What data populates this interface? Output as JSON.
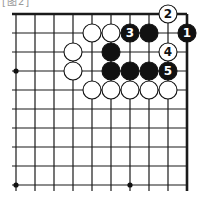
{
  "caption": "[图2]",
  "board": {
    "origin_x": 16,
    "origin_y": 14,
    "spacing": 19,
    "cols": 10,
    "rows": 10,
    "line_color": "#1a1a1a",
    "star_points": [
      [
        0,
        3
      ],
      [
        0,
        9
      ],
      [
        6,
        9
      ]
    ]
  },
  "stones": [
    {
      "col": 9,
      "row": 1,
      "color": "black",
      "label": "1"
    },
    {
      "col": 8,
      "row": 0,
      "color": "white",
      "label": "2"
    },
    {
      "col": 6,
      "row": 1,
      "color": "black",
      "label": "3"
    },
    {
      "col": 8,
      "row": 2,
      "color": "white",
      "label": "4"
    },
    {
      "col": 8,
      "row": 3,
      "color": "black",
      "label": "5"
    },
    {
      "col": 4,
      "row": 1,
      "color": "white",
      "label": ""
    },
    {
      "col": 5,
      "row": 1,
      "color": "white",
      "label": ""
    },
    {
      "col": 7,
      "row": 1,
      "color": "black",
      "label": ""
    },
    {
      "col": 3,
      "row": 2,
      "color": "white",
      "label": ""
    },
    {
      "col": 5,
      "row": 2,
      "color": "black",
      "label": ""
    },
    {
      "col": 3,
      "row": 3,
      "color": "white",
      "label": ""
    },
    {
      "col": 5,
      "row": 3,
      "color": "black",
      "label": ""
    },
    {
      "col": 6,
      "row": 3,
      "color": "black",
      "label": ""
    },
    {
      "col": 7,
      "row": 3,
      "color": "black",
      "label": ""
    },
    {
      "col": 4,
      "row": 4,
      "color": "white",
      "label": ""
    },
    {
      "col": 5,
      "row": 4,
      "color": "white",
      "label": ""
    },
    {
      "col": 6,
      "row": 4,
      "color": "white",
      "label": ""
    },
    {
      "col": 7,
      "row": 4,
      "color": "white",
      "label": ""
    },
    {
      "col": 8,
      "row": 4,
      "color": "white",
      "label": ""
    }
  ]
}
